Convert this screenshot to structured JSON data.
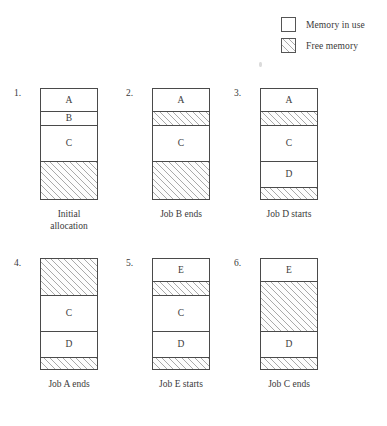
{
  "legend": {
    "items": [
      {
        "icon": "white-square-swatch",
        "label": "Memory in use",
        "fill": "solid"
      },
      {
        "icon": "hatched-square-swatch",
        "label": "Free memory",
        "fill": "hatch"
      }
    ]
  },
  "colors": {
    "line": "#4a4a4a",
    "text": "#3a3a3a",
    "hatch": "#a9a9a9",
    "background": "#ffffff"
  },
  "diagram": {
    "type": "memory-allocation-timeline",
    "box_count": 6,
    "cells": [
      {
        "index": "1.",
        "caption": "Initial\nallocation",
        "segments": [
          {
            "label": "A",
            "fill": "solid",
            "height_pct": 20.5
          },
          {
            "label": "B",
            "fill": "solid",
            "height_pct": 13.4
          },
          {
            "label": "C",
            "fill": "solid",
            "height_pct": 32.1
          },
          {
            "label": "",
            "fill": "hatch",
            "height_pct": 34.0
          }
        ]
      },
      {
        "index": "2.",
        "caption": "Job B ends",
        "segments": [
          {
            "label": "A",
            "fill": "solid",
            "height_pct": 20.5
          },
          {
            "label": "",
            "fill": "hatch",
            "height_pct": 13.4
          },
          {
            "label": "C",
            "fill": "solid",
            "height_pct": 32.1
          },
          {
            "label": "",
            "fill": "hatch",
            "height_pct": 34.0
          }
        ]
      },
      {
        "index": "3.",
        "caption": "Job D starts",
        "segments": [
          {
            "label": "A",
            "fill": "solid",
            "height_pct": 20.5
          },
          {
            "label": "",
            "fill": "hatch",
            "height_pct": 13.4
          },
          {
            "label": "C",
            "fill": "solid",
            "height_pct": 32.1
          },
          {
            "label": "D",
            "fill": "solid",
            "height_pct": 24.2
          },
          {
            "label": "",
            "fill": "hatch",
            "height_pct": 9.8
          }
        ]
      },
      {
        "index": "4.",
        "caption": "Job A ends",
        "segments": [
          {
            "label": "",
            "fill": "hatch",
            "height_pct": 33.9
          },
          {
            "label": "C",
            "fill": "solid",
            "height_pct": 32.1
          },
          {
            "label": "D",
            "fill": "solid",
            "height_pct": 24.2
          },
          {
            "label": "",
            "fill": "hatch",
            "height_pct": 9.8
          }
        ]
      },
      {
        "index": "5.",
        "caption": "Job E starts",
        "segments": [
          {
            "label": "E",
            "fill": "solid",
            "height_pct": 20.5
          },
          {
            "label": "",
            "fill": "hatch",
            "height_pct": 13.4
          },
          {
            "label": "C",
            "fill": "solid",
            "height_pct": 32.1
          },
          {
            "label": "D",
            "fill": "solid",
            "height_pct": 24.2
          },
          {
            "label": "",
            "fill": "hatch",
            "height_pct": 9.8
          }
        ]
      },
      {
        "index": "6.",
        "caption": "Job C ends",
        "segments": [
          {
            "label": "E",
            "fill": "solid",
            "height_pct": 20.5
          },
          {
            "label": "",
            "fill": "hatch",
            "height_pct": 45.5
          },
          {
            "label": "D",
            "fill": "solid",
            "height_pct": 24.2
          },
          {
            "label": "",
            "fill": "hatch",
            "height_pct": 9.8
          }
        ]
      }
    ]
  }
}
